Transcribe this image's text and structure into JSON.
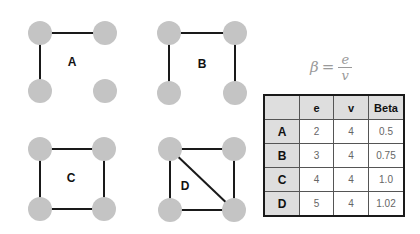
{
  "formula": {
    "lhs": "β",
    "eq": "=",
    "numerator": "e",
    "denominator": "v"
  },
  "colors": {
    "node": "#c4c4c4",
    "edge": "#1a1a1a",
    "header_bg": "#dedede"
  },
  "graphs": [
    {
      "label": "A",
      "edges": [
        [
          "tl",
          "tr"
        ],
        [
          "tl",
          "bl"
        ]
      ]
    },
    {
      "label": "B",
      "edges": [
        [
          "tl",
          "tr"
        ],
        [
          "tl",
          "bl"
        ],
        [
          "tr",
          "br"
        ]
      ]
    },
    {
      "label": "C",
      "edges": [
        [
          "tl",
          "tr"
        ],
        [
          "tl",
          "bl"
        ],
        [
          "tr",
          "br"
        ],
        [
          "bl",
          "br"
        ]
      ]
    },
    {
      "label": "D",
      "edges": [
        [
          "tl",
          "tr"
        ],
        [
          "tl",
          "bl"
        ],
        [
          "tr",
          "br"
        ],
        [
          "bl",
          "br"
        ],
        [
          "tl",
          "br"
        ]
      ]
    }
  ],
  "table": {
    "headers": [
      "",
      "e",
      "v",
      "Beta"
    ],
    "rows": [
      {
        "name": "A",
        "e": "2",
        "v": "4",
        "beta": "0.5"
      },
      {
        "name": "B",
        "e": "3",
        "v": "4",
        "beta": "0.75"
      },
      {
        "name": "C",
        "e": "4",
        "v": "4",
        "beta": "1.0"
      },
      {
        "name": "D",
        "e": "5",
        "v": "4",
        "beta": "1.02"
      }
    ]
  }
}
